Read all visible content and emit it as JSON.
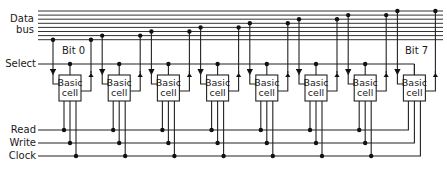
{
  "diagram": {
    "labels": {
      "data_bus_line1": "Data",
      "data_bus_line2": "bus",
      "bit_first": "Bit 0",
      "bit_last": "Bit 7",
      "select": "Select",
      "read": "Read",
      "write": "Write",
      "clock": "Clock"
    },
    "cell_label_line1": "Basic",
    "cell_label_line2": "cell",
    "cell_count": 8,
    "bus_line_count": 8,
    "colors": {
      "line": "#222222",
      "background": "#ffffff"
    }
  }
}
